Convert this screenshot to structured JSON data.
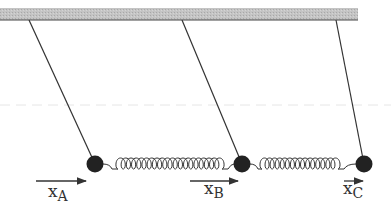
{
  "diagram": {
    "ceiling": {
      "x": 0,
      "y": 8,
      "width": 358,
      "height": 12,
      "fill": "#bdbdbd",
      "edge": "#555555"
    },
    "guide_line": {
      "y": 105,
      "color": "#e2e2e2"
    },
    "masses": [
      {
        "id": "A",
        "cx": 95,
        "cy": 164,
        "r": 8,
        "string_top": [
          29,
          20
        ]
      },
      {
        "id": "B",
        "cx": 242,
        "cy": 164,
        "r": 8,
        "string_top": [
          182,
          20
        ]
      },
      {
        "id": "C",
        "cx": 364,
        "cy": 164,
        "r": 8,
        "string_top": [
          336,
          20
        ]
      }
    ],
    "springs": [
      {
        "from": "A",
        "to": "B",
        "x1": 103,
        "x2": 234,
        "coil_start": 118,
        "coil_end": 222,
        "coils": 20
      },
      {
        "from": "B",
        "to": "C",
        "x1": 250,
        "x2": 356,
        "coil_start": 262,
        "coil_end": 338,
        "coils": 15
      }
    ],
    "displacements": [
      {
        "id": "A",
        "label": "x",
        "sub": "A",
        "arrow": [
          36,
          86,
          181
        ],
        "label_pos": [
          50,
          196
        ]
      },
      {
        "id": "B",
        "label": "x",
        "sub": "B",
        "arrow": [
          190,
          238,
          181
        ],
        "label_pos": [
          205,
          193
        ]
      },
      {
        "id": "C",
        "label": "x",
        "sub": "C",
        "arrow": [
          344,
          363,
          181
        ],
        "label_pos": [
          345,
          193
        ]
      }
    ]
  },
  "labels": {
    "xA": "x",
    "xA_sub": "A",
    "xB": "x",
    "xB_sub": "B",
    "xC": "x",
    "xC_sub": "C"
  }
}
